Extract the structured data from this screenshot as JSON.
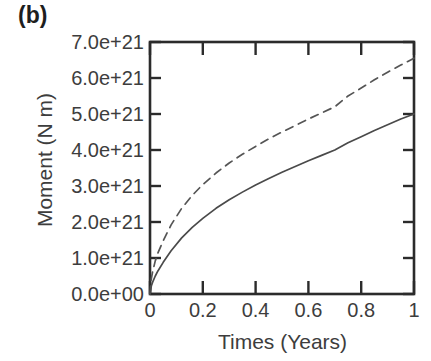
{
  "figure": {
    "panel_label": "(b)",
    "background_color": "#ffffff",
    "axis_color": "#2b2b2b",
    "text_color": "#3d3d3d"
  },
  "chart_data": {
    "type": "line",
    "title": "",
    "panel": "(b)",
    "xlabel": "Times (Years)",
    "ylabel": "Moment (N m)",
    "xlim": [
      0,
      1
    ],
    "ylim": [
      0,
      7e+21
    ],
    "grid": false,
    "legend": "none",
    "xticks": [
      0,
      0.2,
      0.4,
      0.6,
      0.8,
      1
    ],
    "xtick_labels": [
      "0",
      "0.2",
      "0.4",
      "0.6",
      "0.8",
      "1"
    ],
    "yticks": [
      0,
      1e+21,
      2e+21,
      3e+21,
      4e+21,
      5e+21,
      6e+21,
      7e+21
    ],
    "ytick_labels": [
      "0.0e+00",
      "1.0e+21",
      "2.0e+21",
      "3.0e+21",
      "4.0e+21",
      "5.0e+21",
      "6.0e+21",
      "7.0e+21"
    ],
    "x": [
      0,
      0.005,
      0.01,
      0.02,
      0.03,
      0.05,
      0.08,
      0.12,
      0.16,
      0.2,
      0.25,
      0.3,
      0.35,
      0.4,
      0.45,
      0.5,
      0.55,
      0.6,
      0.65,
      0.7,
      0.75,
      0.8,
      0.85,
      0.9,
      0.95,
      1.0
    ],
    "series": [
      {
        "name": "dashed-curve",
        "style": "dashed",
        "color": "#555555",
        "values": [
          0,
          4.2e+20,
          6.2e+20,
          9.2e+20,
          1.14e+21,
          1.48e+21,
          1.92e+21,
          2.38e+21,
          2.74e+21,
          3.04e+21,
          3.36e+21,
          3.64e+21,
          3.88e+21,
          4.1e+21,
          4.31e+21,
          4.5e+21,
          4.68e+21,
          4.86e+21,
          5.03e+21,
          5.2e+21,
          5.5e+21,
          5.72e+21,
          5.95e+21,
          6.16e+21,
          6.36e+21,
          6.55e+21
        ]
      },
      {
        "name": "solid-curve",
        "style": "solid",
        "color": "#4a4a4a",
        "values": [
          0,
          2.2e+20,
          3.3e+20,
          5e+20,
          6.4e+20,
          8.8e+20,
          1.2e+21,
          1.56e+21,
          1.85e+21,
          2.1e+21,
          2.38e+21,
          2.62e+21,
          2.83e+21,
          3.03e+21,
          3.21e+21,
          3.38e+21,
          3.54e+21,
          3.7e+21,
          3.85e+21,
          4e+21,
          4.2e+21,
          4.37e+21,
          4.54e+21,
          4.7e+21,
          4.86e+21,
          5e+21
        ]
      }
    ]
  }
}
